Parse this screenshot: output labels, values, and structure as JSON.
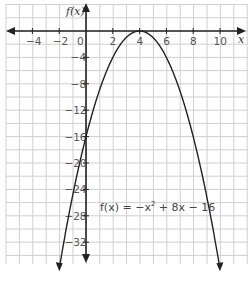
{
  "chart_data": {
    "type": "line",
    "title": "",
    "equation": "f(x) = −x² + 8x − 16",
    "xlabel": "x",
    "ylabel": "f(x)",
    "xlim": [
      -6,
      12
    ],
    "ylim": [
      -36,
      4
    ],
    "x_ticks": [
      -4,
      -2,
      0,
      2,
      4,
      6,
      8,
      10
    ],
    "y_ticks": [
      -4,
      -8,
      -12,
      -16,
      -20,
      -24,
      -28,
      -32
    ],
    "grid": true,
    "series": [
      {
        "name": "f(x) = −x² + 8x − 16",
        "vertex": [
          4,
          0
        ],
        "y_intercept": -16,
        "points": [
          [
            -2,
            -36
          ],
          [
            -1,
            -25
          ],
          [
            0,
            -16
          ],
          [
            1,
            -9
          ],
          [
            2,
            -4
          ],
          [
            3,
            -1
          ],
          [
            4,
            0
          ],
          [
            5,
            -1
          ],
          [
            6,
            -4
          ],
          [
            7,
            -9
          ],
          [
            8,
            -16
          ],
          [
            9,
            -25
          ],
          [
            10,
            -36
          ]
        ]
      }
    ]
  },
  "labels": {
    "x_axis": "x",
    "y_axis": "f(x)",
    "origin": "0",
    "equation_prefix": "f(x) = −x",
    "equation_exp": "2",
    "equation_suffix": " + 8x − 16",
    "x_ticks": [
      "−4",
      "−2",
      "2",
      "4",
      "6",
      "8",
      "10"
    ],
    "y_ticks": [
      "−4",
      "−8",
      "−12",
      "−16",
      "−20",
      "−24",
      "−28",
      "−32"
    ]
  }
}
